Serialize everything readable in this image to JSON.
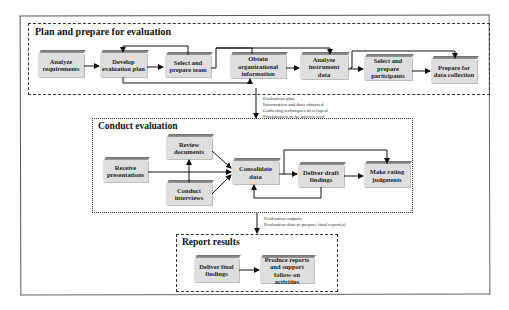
{
  "sections": {
    "plan": {
      "title": "Plan and prepare for evaluation",
      "steps": [
        {
          "label": "Analyze requirements"
        },
        {
          "label": "Develop evaluation plan"
        },
        {
          "label": "Select and prepare team"
        },
        {
          "label": "Obtain organizational information"
        },
        {
          "label": "Analyze instrument data"
        },
        {
          "label": "Select and prepare participants"
        },
        {
          "label": "Prepare for data collection"
        }
      ]
    },
    "conduct": {
      "title": "Conduct evaluation",
      "steps": [
        {
          "label": "Receive presentations"
        },
        {
          "label": "Review documents"
        },
        {
          "label": "Conduct interviews"
        },
        {
          "label": "Consolidate data"
        },
        {
          "label": "Deliver draft findings"
        },
        {
          "label": "Make rating judgments"
        }
      ]
    },
    "report": {
      "title": "Report results",
      "steps": [
        {
          "label": "Deliver final findings"
        },
        {
          "label": "Produce reports and support follow-on activities"
        }
      ]
    }
  },
  "transitions": {
    "plan_to_conduct": [
      "Evaluation plan",
      "Information and data obtained",
      "Gathering techniques developed",
      "Practitioners to be interviewed"
    ],
    "conduct_to_report": [
      "Evaluation outputs",
      "Evaluation data to prepare final report(s)"
    ]
  }
}
